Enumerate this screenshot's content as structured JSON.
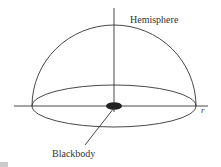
{
  "diagram": {
    "labels": {
      "hemisphere": "Hemisphere",
      "radius": "r",
      "blackbody": "Blackbody"
    },
    "colors": {
      "line": "#333333",
      "blackbody_fill": "#222222",
      "background": "#ffffff"
    }
  }
}
